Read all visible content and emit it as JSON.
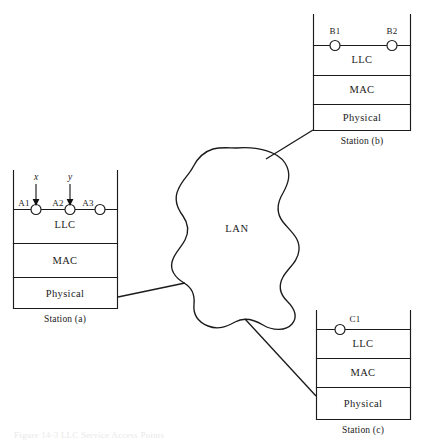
{
  "figure": {
    "caption": "Figure 14-3   LLC Service Access Points",
    "cloud_label": "LAN"
  },
  "stations": [
    {
      "id": "a",
      "caption": "Station (a)",
      "layers": [
        "LLC",
        "MAC",
        "Physical"
      ],
      "saps": [
        {
          "label": "A1"
        },
        {
          "label": "A2"
        },
        {
          "label": "A3"
        }
      ],
      "arrows": [
        {
          "label": "x"
        },
        {
          "label": "y"
        }
      ]
    },
    {
      "id": "b",
      "caption": "Station (b)",
      "layers": [
        "LLC",
        "MAC",
        "Physical"
      ],
      "saps": [
        {
          "label": "B1"
        },
        {
          "label": "B2"
        }
      ],
      "arrows": []
    },
    {
      "id": "c",
      "caption": "Station (c)",
      "layers": [
        "LLC",
        "MAC",
        "Physical"
      ],
      "saps": [
        {
          "label": "C1"
        }
      ],
      "arrows": []
    }
  ],
  "colors": {
    "line": "#1b1b1b",
    "text": "#1a1a1a",
    "background": "#ffffff"
  }
}
